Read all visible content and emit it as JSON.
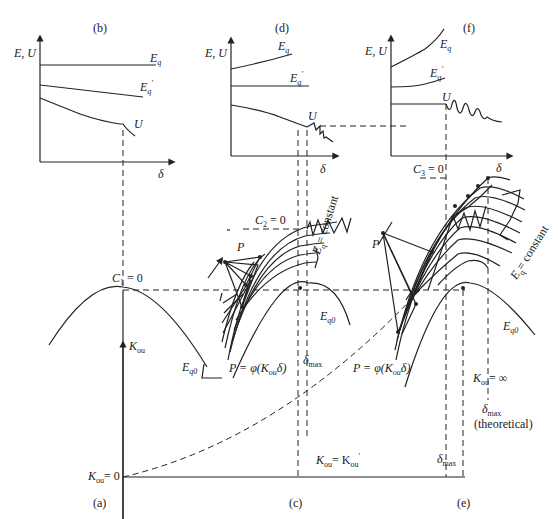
{
  "panels": {
    "a": {
      "label": "(a)"
    },
    "b": {
      "label": "(b)",
      "y_axis": "E, U",
      "x_axis": "δ",
      "curves": [
        "Eq",
        "Eq'",
        "U"
      ]
    },
    "c": {
      "label": "(c)"
    },
    "d": {
      "label": "(d)",
      "y_axis": "E, U",
      "x_axis": "δ",
      "curves": [
        "Eq",
        "Eq'",
        "U"
      ]
    },
    "e": {
      "label": "(e)"
    },
    "f": {
      "label": "(f)",
      "y_axis": "E, U",
      "x_axis": "δ",
      "curves": [
        "Eq",
        "Eq'",
        "U"
      ]
    }
  },
  "annotations": {
    "c1": "C",
    "c1_sub": "1",
    "c1_val": " = 0",
    "c2": "C",
    "c2_sub": "2",
    "c2_val": " = 0",
    "c3": "C",
    "c3_sub": "3",
    "c3_val": " = 0",
    "kou_axis": "K",
    "kou_sub": "ou",
    "kou_zero": "= 0",
    "kou_prime": "= K",
    "kou_inf": "= ∞",
    "eq0": "E",
    "eq0_sub": "q0",
    "p": "P",
    "p_phi": "P = φ(K",
    "p_phi_end": "δ)",
    "eq_const": "E",
    "eq_const_sub": "q",
    "eq_const_text": "= constant",
    "dmax": "δ",
    "dmax_sub": "max",
    "theoretical": "(theoretical)",
    "e_u": "E, U",
    "delta": "δ",
    "eq": "E",
    "eq_sub": "q",
    "eqp_sup": "′",
    "u": "U"
  }
}
